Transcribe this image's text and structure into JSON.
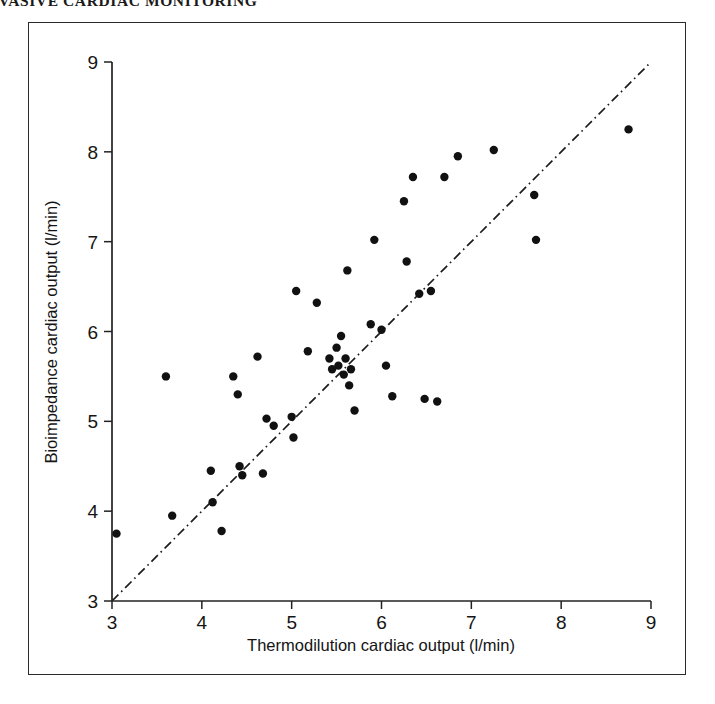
{
  "page": {
    "running_head": "NON-INVASIVE CARDIAC MONITORING"
  },
  "figure": {
    "border_color": "#2a2a2a",
    "background": "#ffffff"
  },
  "chart_data": {
    "type": "scatter",
    "title": "",
    "xlabel": "Thermodilution cardiac output (l/min)",
    "ylabel": "Bioimpedance cardiac output (l/min)",
    "xlim": [
      3,
      9
    ],
    "ylim": [
      3,
      9
    ],
    "xticks": [
      3,
      4,
      5,
      6,
      7,
      8,
      9
    ],
    "yticks": [
      3,
      4,
      5,
      6,
      7,
      8,
      9
    ],
    "xtick_labels": [
      "3",
      "4",
      "5",
      "6",
      "7",
      "8",
      "9"
    ],
    "ytick_labels": [
      "3",
      "4",
      "5",
      "6",
      "7",
      "8",
      "9"
    ],
    "grid": false,
    "legend": null,
    "point_color": "#111111",
    "point_radius": 4.2,
    "reference_line": {
      "name": "line-of-identity",
      "style": "dash-dot",
      "color": "#1b1b1b",
      "x": [
        3.0,
        9.0
      ],
      "y": [
        3.0,
        9.0
      ]
    },
    "points": [
      [
        3.05,
        3.75
      ],
      [
        3.6,
        5.5
      ],
      [
        3.67,
        3.95
      ],
      [
        4.1,
        4.45
      ],
      [
        4.12,
        4.1
      ],
      [
        4.22,
        3.78
      ],
      [
        4.35,
        5.5
      ],
      [
        4.4,
        5.3
      ],
      [
        4.42,
        4.5
      ],
      [
        4.45,
        4.4
      ],
      [
        4.62,
        5.72
      ],
      [
        4.68,
        4.42
      ],
      [
        4.72,
        5.03
      ],
      [
        4.8,
        4.95
      ],
      [
        5.0,
        5.05
      ],
      [
        5.02,
        4.82
      ],
      [
        5.05,
        6.45
      ],
      [
        5.18,
        5.78
      ],
      [
        5.28,
        6.32
      ],
      [
        5.42,
        5.7
      ],
      [
        5.45,
        5.58
      ],
      [
        5.5,
        5.82
      ],
      [
        5.52,
        5.62
      ],
      [
        5.55,
        5.95
      ],
      [
        5.58,
        5.52
      ],
      [
        5.6,
        5.7
      ],
      [
        5.62,
        6.68
      ],
      [
        5.64,
        5.4
      ],
      [
        5.66,
        5.58
      ],
      [
        5.7,
        5.12
      ],
      [
        5.88,
        6.08
      ],
      [
        5.92,
        7.02
      ],
      [
        6.0,
        6.02
      ],
      [
        6.05,
        5.62
      ],
      [
        6.12,
        5.28
      ],
      [
        6.25,
        7.45
      ],
      [
        6.28,
        6.78
      ],
      [
        6.35,
        7.72
      ],
      [
        6.42,
        6.42
      ],
      [
        6.48,
        5.25
      ],
      [
        6.55,
        6.45
      ],
      [
        6.62,
        5.22
      ],
      [
        6.7,
        7.72
      ],
      [
        6.85,
        7.95
      ],
      [
        7.25,
        8.02
      ],
      [
        7.7,
        7.52
      ],
      [
        7.72,
        7.02
      ],
      [
        8.75,
        8.25
      ]
    ]
  }
}
